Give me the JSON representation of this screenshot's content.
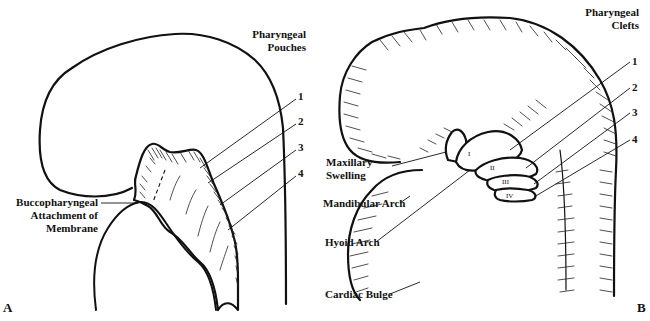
{
  "figure": {
    "type": "anatomical line drawing"
  },
  "panel_a": {
    "letter": "A",
    "heading_line1": "Pharyngeal",
    "heading_line2": "Pouches",
    "numbers": [
      "1",
      "2",
      "3",
      "4"
    ],
    "buccopharyngeal": {
      "line1": "Buccopharyngeal",
      "line2": "Attachment of",
      "line3": "Membrane"
    }
  },
  "panel_b": {
    "letter": "B",
    "heading_line1": "Pharyngeal",
    "heading_line2": "Clefts",
    "numbers": [
      "1",
      "2",
      "3",
      "4"
    ],
    "arch_numerals": [
      "I",
      "II",
      "III",
      "IV"
    ],
    "labels": {
      "maxillary_line1": "Maxillary",
      "maxillary_line2": "Swelling",
      "mandibular": "Mandibular Arch",
      "hyoid": "Hyoid Arch",
      "cardiac": "Cardiac Bulge"
    }
  },
  "colors": {
    "ink": "#111111",
    "background": "#ffffff"
  }
}
